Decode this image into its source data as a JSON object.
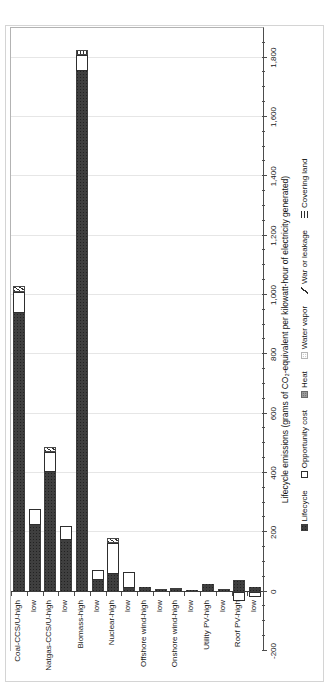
{
  "figure": {
    "axis_title": "Lifecycle emissions (grams of CO₂-equivalent per kilowatt-hour of electricity generated)"
  },
  "chart_data": {
    "type": "bar",
    "orientation": "horizontal stacked bars; whole figure rotated 90° counter-clockwise in the screenshot",
    "title": "",
    "xlabel": "Lifecycle emissions (grams of CO₂-equivalent per kilowatt-hour of electricity generated)",
    "ylabel": "",
    "grid": "major gridlines every 200, light gray",
    "legend_position": "bottom (right edge of rotated screenshot)",
    "value_axis": {
      "min": -200,
      "max": 1900,
      "major_step": 200,
      "minor_step": 50,
      "ticks": [
        {
          "v": -200,
          "label": "-200"
        },
        {
          "v": 0,
          "label": "0"
        },
        {
          "v": 200,
          "label": "200"
        },
        {
          "v": 400,
          "label": "400"
        },
        {
          "v": 600,
          "label": "600"
        },
        {
          "v": 800,
          "label": "800"
        },
        {
          "v": 1000,
          "label": "1,000"
        },
        {
          "v": 1200,
          "label": "1,200"
        },
        {
          "v": 1400,
          "label": "1,400"
        },
        {
          "v": 1600,
          "label": "1,600"
        },
        {
          "v": 1800,
          "label": "1,800"
        }
      ]
    },
    "categories": [
      "Coal-CCS/U-high",
      "low",
      "Natgas-CCS/U-high",
      "low",
      "Biomass-high",
      "low",
      "Nuclear-high",
      "low",
      "Offshore wind-high",
      "low",
      "Onshore wind-high",
      "low",
      "Utility PV-high",
      "low",
      "Roof PV-high",
      "low"
    ],
    "bars": [
      {
        "category": "Coal-CCS/U-high",
        "segments": [
          {
            "name": "Lifecycle",
            "from": 0,
            "to": 940
          },
          {
            "name": "Opportunity cost",
            "from": 940,
            "to": 1010
          },
          {
            "name": "War or leakage",
            "from": 1010,
            "to": 1030
          }
        ]
      },
      {
        "category": "low",
        "segments": [
          {
            "name": "Lifecycle",
            "from": 0,
            "to": 225
          },
          {
            "name": "Opportunity cost",
            "from": 225,
            "to": 277
          }
        ]
      },
      {
        "category": "Natgas-CCS/U-high",
        "segments": [
          {
            "name": "Lifecycle",
            "from": 0,
            "to": 405
          },
          {
            "name": "Opportunity cost",
            "from": 405,
            "to": 470
          },
          {
            "name": "War or leakage",
            "from": 470,
            "to": 487
          }
        ]
      },
      {
        "category": "low",
        "segments": [
          {
            "name": "Lifecycle",
            "from": 0,
            "to": 175
          },
          {
            "name": "Opportunity cost",
            "from": 175,
            "to": 220
          }
        ]
      },
      {
        "category": "Biomass-high",
        "segments": [
          {
            "name": "Lifecycle",
            "from": 0,
            "to": 1755
          },
          {
            "name": "Opportunity cost",
            "from": 1755,
            "to": 1810
          },
          {
            "name": "Covering land",
            "from": 1810,
            "to": 1825
          }
        ]
      },
      {
        "category": "low",
        "segments": [
          {
            "name": "Lifecycle",
            "from": 0,
            "to": 38
          },
          {
            "name": "Opportunity cost",
            "from": 38,
            "to": 72
          }
        ]
      },
      {
        "category": "Nuclear-high",
        "segments": [
          {
            "name": "Lifecycle",
            "from": 0,
            "to": 60
          },
          {
            "name": "Opportunity cost",
            "from": 60,
            "to": 165
          },
          {
            "name": "War or leakage",
            "from": 165,
            "to": 182
          }
        ]
      },
      {
        "category": "low",
        "segments": [
          {
            "name": "Lifecycle",
            "from": 0,
            "to": 12
          },
          {
            "name": "Opportunity cost",
            "from": 12,
            "to": 67
          }
        ]
      },
      {
        "category": "Offshore wind-high",
        "segments": [
          {
            "name": "Lifecycle",
            "from": 0,
            "to": 16
          }
        ]
      },
      {
        "category": "low",
        "segments": [
          {
            "name": "Lifecycle",
            "from": 0,
            "to": 9
          }
        ]
      },
      {
        "category": "Onshore wind-high",
        "segments": [
          {
            "name": "Lifecycle",
            "from": 0,
            "to": 11
          }
        ]
      },
      {
        "category": "low",
        "segments": [
          {
            "name": "Lifecycle",
            "from": 0,
            "to": 5
          }
        ]
      },
      {
        "category": "Utility PV-high",
        "segments": [
          {
            "name": "Lifecycle",
            "from": 0,
            "to": 27
          }
        ]
      },
      {
        "category": "low",
        "segments": [
          {
            "name": "Lifecycle",
            "from": 0,
            "to": 10
          }
        ]
      },
      {
        "category": "Roof PV-high",
        "segments": [
          {
            "name": "Lifecycle",
            "from": 0,
            "to": 40
          },
          {
            "name": "Opportunity cost",
            "from": -30,
            "to": 0
          }
        ]
      },
      {
        "category": "low",
        "segments": [
          {
            "name": "Lifecycle",
            "from": 0,
            "to": 15
          },
          {
            "name": "Opportunity cost",
            "from": -17,
            "to": 0
          }
        ]
      }
    ],
    "legend": [
      {
        "label": "Lifecycle",
        "pattern": "solid-dark"
      },
      {
        "label": "Opportunity cost",
        "pattern": "white-outline"
      },
      {
        "label": "Heat",
        "pattern": "gray-dots"
      },
      {
        "label": "Water vapor",
        "pattern": "light-dots"
      },
      {
        "label": "War or leakage",
        "pattern": "diagonal-hatch"
      },
      {
        "label": "Covering land",
        "pattern": "horizontal-lines"
      }
    ],
    "colors": {
      "bar_dark": "#3f3f3f",
      "segment_outline": "#2e2e2e",
      "gridline": "#e6e6e6",
      "axis_line": "#4d4d4d",
      "figure_border": "#d4d4d4"
    }
  }
}
